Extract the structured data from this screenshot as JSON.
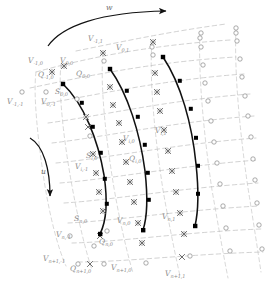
{
  "figure": {
    "type": "diagram",
    "width": 267,
    "height": 286,
    "background": "#ffffff",
    "colors": {
      "blade_curve": "#000000",
      "grid_line": "#b4b4b4",
      "node_outline": "#8c8c8c",
      "label_text": "#8a8a8a",
      "arrow": "#111111"
    }
  },
  "arrows": [
    {
      "id": "w-arrow",
      "label": "w",
      "description": "curved arrow across top pointing right"
    },
    {
      "id": "u-arrow",
      "label": "u",
      "description": "curved arrow at left pointing down"
    }
  ],
  "markers": {
    "vertex_node": {
      "name": "open-circle",
      "meaning": "V node"
    },
    "flux_node": {
      "name": "cross-mark",
      "meaning": "Q node"
    },
    "blade_node": {
      "name": "filled-square",
      "meaning": "S node on blade surface"
    }
  },
  "labels": [
    {
      "id": "lbl-w",
      "base": "w",
      "sub": "",
      "x": 106,
      "y": 4
    },
    {
      "id": "lbl-u",
      "base": "u",
      "sub": "",
      "x": 41,
      "y": 168
    },
    {
      "id": "lbl-v-m1-1",
      "base": "V",
      "sub": "-1,1",
      "x": 88,
      "y": 35
    },
    {
      "id": "lbl-v-0-1",
      "base": "V",
      "sub": "0,1",
      "x": 116,
      "y": 44
    },
    {
      "id": "lbl-v-m1-0",
      "base": "V",
      "sub": "-1,0",
      "x": 28,
      "y": 57
    },
    {
      "id": "lbl-v-0-0",
      "base": "V",
      "sub": "0,0",
      "x": 60,
      "y": 57
    },
    {
      "id": "lbl-q-m1-0",
      "base": "Q",
      "sub": "-1,0",
      "x": 38,
      "y": 71
    },
    {
      "id": "lbl-q-0-0",
      "base": "Q",
      "sub": "0,0",
      "x": 76,
      "y": 70
    },
    {
      "id": "lbl-s-0-0",
      "base": "S",
      "sub": "0,0",
      "x": 55,
      "y": 88
    },
    {
      "id": "lbl-v-m1-m1",
      "base": "V",
      "sub": "-1,-1",
      "x": 7,
      "y": 98
    },
    {
      "id": "lbl-v-0-m1",
      "base": "V",
      "sub": "0,-1",
      "x": 41,
      "y": 98
    },
    {
      "id": "lbl-v-i-1",
      "base": "V",
      "sub": "i,1",
      "x": 155,
      "y": 127
    },
    {
      "id": "lbl-v-i-0",
      "base": "V",
      "sub": "i,0",
      "x": 123,
      "y": 135
    },
    {
      "id": "lbl-s-i-0",
      "base": "S",
      "sub": "i,0",
      "x": 86,
      "y": 152
    },
    {
      "id": "lbl-q-i-0",
      "base": "Q",
      "sub": "i,0",
      "x": 129,
      "y": 155
    },
    {
      "id": "lbl-v-i-m1",
      "base": "V",
      "sub": "i,-1",
      "x": 75,
      "y": 163
    },
    {
      "id": "lbl-v-n-1",
      "base": "V",
      "sub": "n,1",
      "x": 162,
      "y": 213
    },
    {
      "id": "lbl-v-n-0",
      "base": "V",
      "sub": "n,0",
      "x": 117,
      "y": 217
    },
    {
      "id": "lbl-s-n-0",
      "base": "S",
      "sub": "n,0",
      "x": 74,
      "y": 215
    },
    {
      "id": "lbl-v-n-m1",
      "base": "V",
      "sub": "n,-1",
      "x": 56,
      "y": 231
    },
    {
      "id": "lbl-q-n-0",
      "base": "Q",
      "sub": "n,0",
      "x": 99,
      "y": 238
    },
    {
      "id": "lbl-v-np1-m1",
      "base": "V",
      "sub": "n+1,-1",
      "x": 43,
      "y": 255
    },
    {
      "id": "lbl-q-np1-0",
      "base": "Q",
      "sub": "n+1,0",
      "x": 70,
      "y": 265
    },
    {
      "id": "lbl-v-np1-0",
      "base": "V",
      "sub": "n+1,0",
      "x": 111,
      "y": 264
    },
    {
      "id": "lbl-v-np1-1",
      "base": "V",
      "sub": "n+1,1",
      "x": 165,
      "y": 270
    }
  ]
}
